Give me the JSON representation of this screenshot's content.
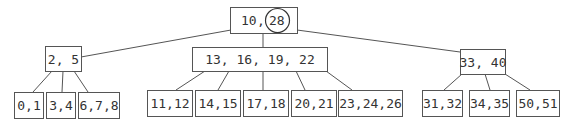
{
  "diagram": {
    "type": "b-tree",
    "root": {
      "id": "root",
      "keys": [
        "10",
        "28"
      ],
      "label": "10, 28",
      "highlighted_key": "28"
    },
    "internal": [
      {
        "id": "n-left",
        "label": "2, 5",
        "keys": [
          "2",
          "5"
        ],
        "parent": "root"
      },
      {
        "id": "n-mid",
        "label": "13, 16, 19, 22",
        "keys": [
          "13",
          "16",
          "19",
          "22"
        ],
        "parent": "root"
      },
      {
        "id": "n-right",
        "label": "33, 40",
        "keys": [
          "33",
          "40"
        ],
        "parent": "root"
      }
    ],
    "leaves": [
      {
        "id": "l0",
        "label": "0,1",
        "parent": "n-left"
      },
      {
        "id": "l1",
        "label": "3,4",
        "parent": "n-left"
      },
      {
        "id": "l2",
        "label": "6,7,8",
        "parent": "n-left"
      },
      {
        "id": "l3",
        "label": "11,12",
        "parent": "n-mid"
      },
      {
        "id": "l4",
        "label": "14,15",
        "parent": "n-mid"
      },
      {
        "id": "l5",
        "label": "17,18",
        "parent": "n-mid"
      },
      {
        "id": "l6",
        "label": "20,21",
        "parent": "n-mid"
      },
      {
        "id": "l7",
        "label": "23,24,26",
        "parent": "n-mid"
      },
      {
        "id": "l8",
        "label": "31,32",
        "parent": "n-right"
      },
      {
        "id": "l9",
        "label": "34,35",
        "parent": "n-right"
      },
      {
        "id": "l10",
        "label": "50,51",
        "parent": "n-right"
      }
    ],
    "colors": {
      "stroke": "#555555",
      "text": "#333333",
      "background": "#ffffff"
    }
  }
}
